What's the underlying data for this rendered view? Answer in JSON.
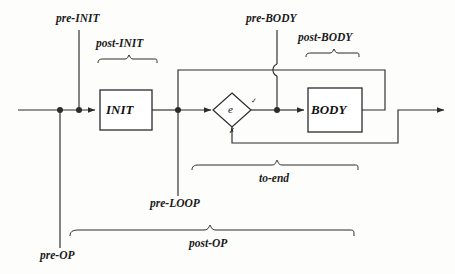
{
  "diagram": {
    "type": "flowchart",
    "stroke_color": "#2b2b2b",
    "text_color": "#111111",
    "background": "#fdfdfc",
    "nodes": [
      {
        "id": "init",
        "label": "INIT",
        "shape": "rectangle"
      },
      {
        "id": "test",
        "label": "e",
        "shape": "diamond"
      },
      {
        "id": "body",
        "label": "BODY",
        "shape": "rectangle"
      }
    ],
    "branch_marks": {
      "true_mark": "✓",
      "false_mark": "✗"
    },
    "point_labels": [
      {
        "id": "pre-init",
        "text": "pre-INIT"
      },
      {
        "id": "post-init",
        "text": "post-INIT"
      },
      {
        "id": "pre-body",
        "text": "pre-BODY"
      },
      {
        "id": "post-body",
        "text": "post-BODY"
      },
      {
        "id": "pre-loop",
        "text": "pre-LOOP"
      },
      {
        "id": "to-end",
        "text": "to-end"
      },
      {
        "id": "pre-op",
        "text": "pre-OP"
      },
      {
        "id": "post-op",
        "text": "post-OP"
      }
    ]
  }
}
